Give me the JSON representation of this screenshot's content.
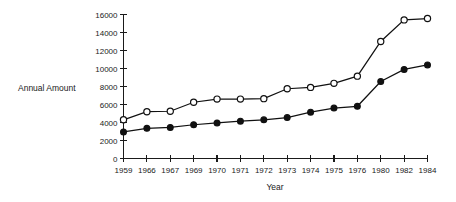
{
  "chart_data": {
    "type": "line",
    "title": "",
    "xlabel": "Year",
    "ylabel": "Annual Amount",
    "grid": false,
    "legend": "none",
    "categories": [
      "1959",
      "1966",
      "1967",
      "1969",
      "1970",
      "1971",
      "1972",
      "1973",
      "1974",
      "1975",
      "1976",
      "1980",
      "1982",
      "1984"
    ],
    "x_tick_labels": [
      "1959",
      "1966",
      "1967",
      "1969",
      "1970",
      "1971",
      "1972",
      "1973",
      "1974",
      "1975",
      "1976",
      "1980",
      "1982",
      "1984"
    ],
    "y_tick_labels": [
      "0",
      "2000",
      "4000",
      "6000",
      "8000",
      "10000",
      "12000",
      "14000",
      "16000"
    ],
    "y_tick_values": [
      0,
      2000,
      4000,
      6000,
      8000,
      10000,
      12000,
      14000,
      16000
    ],
    "ylim": [
      0,
      16000
    ],
    "series": [
      {
        "name": "open-circle-series",
        "marker": "open-circle",
        "color": "#111111",
        "values": [
          4300,
          5200,
          5250,
          6250,
          6600,
          6600,
          6650,
          7750,
          7900,
          8350,
          9150,
          13000,
          15400,
          15550
        ]
      },
      {
        "name": "filled-circle-series",
        "marker": "filled-circle",
        "color": "#111111",
        "values": [
          2950,
          3350,
          3450,
          3750,
          3950,
          4150,
          4300,
          4550,
          5150,
          5600,
          5800,
          8550,
          9900,
          10400
        ]
      }
    ]
  }
}
